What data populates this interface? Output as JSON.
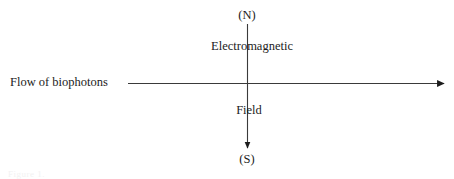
{
  "figure": {
    "background_color": "#ffffff",
    "stroke_color": "#1c1c1c",
    "text_color": "#1c1c1c",
    "caption_remnant": "Figure 1."
  },
  "axes": {
    "vertical": {
      "name": "electromagnetic-field-axis",
      "top_label": "(N)",
      "bottom_label": "(S)",
      "mid_label_top": "Electromagnetic",
      "mid_label_bottom": "Field",
      "direction": "downward",
      "x": 247,
      "y_start": 24,
      "y_end": 152
    },
    "horizontal": {
      "name": "biophoton-flow-axis",
      "label": "Flow of biophotons",
      "direction": "rightward",
      "y": 83,
      "x_start": 128,
      "x_end": 448
    }
  },
  "labels": {
    "north": "(N)",
    "south": "(S)",
    "electromagnetic": "Electromagnetic",
    "field": "Field",
    "flow_of_biophotons": "Flow of biophotons"
  }
}
